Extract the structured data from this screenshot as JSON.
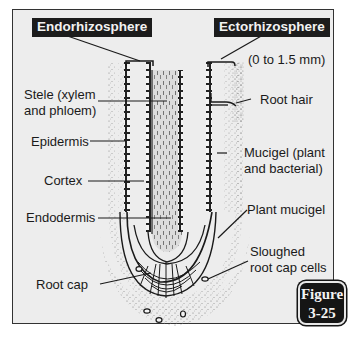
{
  "headers": {
    "left": "Endorhizosphere",
    "right": "Ectorhizosphere"
  },
  "labels": {
    "range": "(0 to 1.5 mm)",
    "stele_line1": "Stele (xylem",
    "stele_line2": "and phloem)",
    "root_hair": "Root hair",
    "epidermis": "Epidermis",
    "mucigel_line1": "Mucigel (plant",
    "mucigel_line2": "and bacterial)",
    "cortex": "Cortex",
    "endodermis": "Endodermis",
    "plant_mucigel": "Plant mucigel",
    "sloughed_line1": "Sloughed",
    "sloughed_line2": "root cap cells",
    "root_cap": "Root cap"
  },
  "figure_badge": {
    "line1": "Figure",
    "line2": "3-25"
  },
  "colors": {
    "background": "#ededed",
    "ink": "#1a1a1a",
    "header_bg": "#1c1c1c",
    "stipple": "#8a8a8a"
  }
}
